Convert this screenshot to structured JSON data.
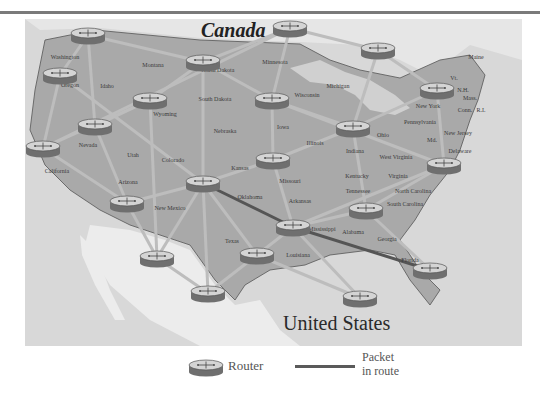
{
  "map": {
    "countries": {
      "canada": {
        "label": "Canada",
        "x": 201,
        "y": 37
      },
      "us": {
        "label": "United States",
        "x": 283,
        "y": 330
      }
    },
    "states": [
      {
        "name": "Washington",
        "x": 65,
        "y": 59
      },
      {
        "name": "Oregon",
        "x": 70,
        "y": 87
      },
      {
        "name": "Idaho",
        "x": 107,
        "y": 88
      },
      {
        "name": "Montana",
        "x": 153,
        "y": 67
      },
      {
        "name": "North Dakota",
        "x": 218,
        "y": 72
      },
      {
        "name": "Minnesota",
        "x": 275,
        "y": 64
      },
      {
        "name": "South Dakota",
        "x": 215,
        "y": 101
      },
      {
        "name": "Wyoming",
        "x": 165,
        "y": 116
      },
      {
        "name": "Nebraska",
        "x": 225,
        "y": 133
      },
      {
        "name": "Iowa",
        "x": 283,
        "y": 129
      },
      {
        "name": "Wisconsin",
        "x": 307,
        "y": 97
      },
      {
        "name": "Michigan",
        "x": 338,
        "y": 88
      },
      {
        "name": "Illinois",
        "x": 315,
        "y": 145
      },
      {
        "name": "Indiana",
        "x": 355,
        "y": 153
      },
      {
        "name": "Ohio",
        "x": 383,
        "y": 137
      },
      {
        "name": "New York",
        "x": 428,
        "y": 108
      },
      {
        "name": "Pennsylvania",
        "x": 420,
        "y": 124
      },
      {
        "name": "New Jersey",
        "x": 458,
        "y": 135
      },
      {
        "name": "Delaware",
        "x": 460,
        "y": 153
      },
      {
        "name": "Md.",
        "x": 432,
        "y": 142
      },
      {
        "name": "Maine",
        "x": 476,
        "y": 59
      },
      {
        "name": "Vt.",
        "x": 454,
        "y": 80
      },
      {
        "name": "N.H.",
        "x": 463,
        "y": 92
      },
      {
        "name": "Mass.",
        "x": 470,
        "y": 100
      },
      {
        "name": "Conn.",
        "x": 465,
        "y": 112
      },
      {
        "name": "R.I.",
        "x": 481,
        "y": 112
      },
      {
        "name": "West Virginia",
        "x": 396,
        "y": 159
      },
      {
        "name": "Virginia",
        "x": 398,
        "y": 178
      },
      {
        "name": "Kentucky",
        "x": 357,
        "y": 178
      },
      {
        "name": "Tennessee",
        "x": 358,
        "y": 193
      },
      {
        "name": "North Carolina",
        "x": 413,
        "y": 193
      },
      {
        "name": "South Carolina",
        "x": 405,
        "y": 206
      },
      {
        "name": "Georgia",
        "x": 387,
        "y": 241
      },
      {
        "name": "Alabama",
        "x": 353,
        "y": 234
      },
      {
        "name": "Mississippi",
        "x": 322,
        "y": 231
      },
      {
        "name": "Florida",
        "x": 410,
        "y": 262
      },
      {
        "name": "Louisiana",
        "x": 298,
        "y": 257
      },
      {
        "name": "Arkansas",
        "x": 300,
        "y": 203
      },
      {
        "name": "Missouri",
        "x": 290,
        "y": 183
      },
      {
        "name": "Kansas",
        "x": 240,
        "y": 170
      },
      {
        "name": "Oklahoma",
        "x": 250,
        "y": 199
      },
      {
        "name": "Texas",
        "x": 232,
        "y": 243
      },
      {
        "name": "New Mexico",
        "x": 170,
        "y": 210
      },
      {
        "name": "Colorado",
        "x": 173,
        "y": 162
      },
      {
        "name": "Utah",
        "x": 133,
        "y": 157
      },
      {
        "name": "Arizona",
        "x": 128,
        "y": 184
      },
      {
        "name": "Nevada",
        "x": 88,
        "y": 147
      },
      {
        "name": "California",
        "x": 57,
        "y": 173
      }
    ],
    "routers": [
      {
        "id": "r1",
        "x": 88,
        "y": 35
      },
      {
        "id": "r2",
        "x": 60,
        "y": 75
      },
      {
        "id": "r3",
        "x": 290,
        "y": 28
      },
      {
        "id": "r4",
        "x": 203,
        "y": 62
      },
      {
        "id": "r5",
        "x": 378,
        "y": 50
      },
      {
        "id": "r6",
        "x": 150,
        "y": 100
      },
      {
        "id": "r7",
        "x": 272,
        "y": 100
      },
      {
        "id": "r8",
        "x": 95,
        "y": 126
      },
      {
        "id": "r9",
        "x": 43,
        "y": 148
      },
      {
        "id": "r10",
        "x": 437,
        "y": 90
      },
      {
        "id": "r11",
        "x": 353,
        "y": 128
      },
      {
        "id": "r12",
        "x": 273,
        "y": 160
      },
      {
        "id": "r13",
        "x": 444,
        "y": 165
      },
      {
        "id": "r14",
        "x": 203,
        "y": 183
      },
      {
        "id": "r15",
        "x": 127,
        "y": 203
      },
      {
        "id": "r16",
        "x": 366,
        "y": 210
      },
      {
        "id": "r17",
        "x": 293,
        "y": 227
      },
      {
        "id": "r18",
        "x": 257,
        "y": 255
      },
      {
        "id": "r19",
        "x": 157,
        "y": 258
      },
      {
        "id": "r20",
        "x": 430,
        "y": 270
      },
      {
        "id": "r21",
        "x": 208,
        "y": 293
      },
      {
        "id": "r22",
        "x": 360,
        "y": 298
      }
    ],
    "links": [
      [
        "r1",
        "r4"
      ],
      [
        "r1",
        "r2"
      ],
      [
        "r1",
        "r8"
      ],
      [
        "r2",
        "r9"
      ],
      [
        "r2",
        "r14"
      ],
      [
        "r3",
        "r4"
      ],
      [
        "r3",
        "r7"
      ],
      [
        "r3",
        "r5"
      ],
      [
        "r3",
        "r9"
      ],
      [
        "r4",
        "r6"
      ],
      [
        "r4",
        "r14"
      ],
      [
        "r4",
        "r7"
      ],
      [
        "r5",
        "r10"
      ],
      [
        "r5",
        "r11"
      ],
      [
        "r6",
        "r8"
      ],
      [
        "r6",
        "r9"
      ],
      [
        "r6",
        "r19"
      ],
      [
        "r7",
        "r12"
      ],
      [
        "r7",
        "r11"
      ],
      [
        "r7",
        "r13"
      ],
      [
        "r8",
        "r15"
      ],
      [
        "r9",
        "r15"
      ],
      [
        "r10",
        "r11"
      ],
      [
        "r10",
        "r13"
      ],
      [
        "r11",
        "r12"
      ],
      [
        "r11",
        "r16"
      ],
      [
        "r12",
        "r14"
      ],
      [
        "r12",
        "r17"
      ],
      [
        "r13",
        "r16"
      ],
      [
        "r13",
        "r17"
      ],
      [
        "r14",
        "r15"
      ],
      [
        "r14",
        "r18"
      ],
      [
        "r14",
        "r19"
      ],
      [
        "r14",
        "r21"
      ],
      [
        "r15",
        "r19"
      ],
      [
        "r16",
        "r17"
      ],
      [
        "r16",
        "r20"
      ],
      [
        "r17",
        "r18"
      ],
      [
        "r17",
        "r22"
      ],
      [
        "r18",
        "r21"
      ],
      [
        "r18",
        "r22"
      ],
      [
        "r19",
        "r21"
      ]
    ],
    "route": [
      "r14",
      "r17",
      "r20"
    ]
  },
  "legend": {
    "router_label": "Router",
    "route_label_line1": "Packet",
    "route_label_line2": "in route"
  },
  "colors": {
    "land": "#a9a9a9",
    "water": "#dcdcdc",
    "mexico": "#e8e8e8",
    "link": "#bdbdbd",
    "route": "#555555",
    "border": "#444444"
  }
}
